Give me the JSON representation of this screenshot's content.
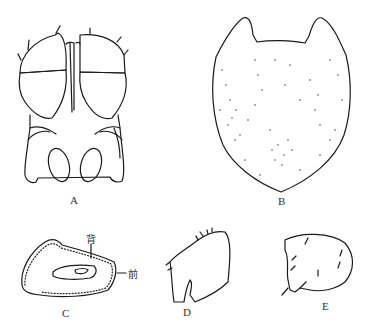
{
  "figure": {
    "panels": [
      {
        "id": "A",
        "label": "A",
        "description": "head/cephalothorax dorsal view with two lobed plates and two oval openings"
      },
      {
        "id": "B",
        "label": "B",
        "description": "stippled shield-shaped plate with two anterior horns"
      },
      {
        "id": "C",
        "label": "C",
        "description": "oval plate outline with inner ring",
        "annotations": [
          "背",
          "前"
        ]
      },
      {
        "id": "D",
        "label": "D",
        "description": "appendage segment with cleft and setae"
      },
      {
        "id": "E",
        "label": "E",
        "description": "rounded segment with setae"
      }
    ],
    "annotations": {
      "dorsal": "背",
      "anterior": "前"
    }
  }
}
